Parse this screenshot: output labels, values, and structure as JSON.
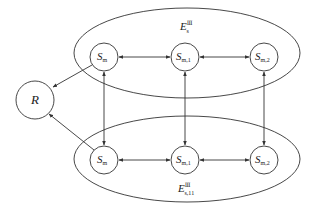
{
  "diagram": {
    "type": "state-graph",
    "colors": {
      "stroke": "#333333",
      "text": "#222222",
      "background": "#ffffff"
    },
    "root": {
      "id": "R",
      "label": "R"
    },
    "groups": [
      {
        "id": "top",
        "label_main": "E",
        "label_sup": "Ⅲ",
        "label_sub": "s",
        "nodes": [
          {
            "id": "t0",
            "main": "S",
            "sub": "m"
          },
          {
            "id": "t1",
            "main": "S",
            "sub": "m,1"
          },
          {
            "id": "t2",
            "main": "S",
            "sub": "m,2"
          }
        ]
      },
      {
        "id": "bottom",
        "label_main": "E",
        "label_sup": "Ⅲ",
        "label_sub": "s,11",
        "nodes": [
          {
            "id": "b0",
            "main": "S",
            "sub": "m"
          },
          {
            "id": "b1",
            "main": "S",
            "sub": "m,1"
          },
          {
            "id": "b2",
            "main": "S",
            "sub": "m,2"
          }
        ]
      }
    ],
    "edges": [
      {
        "from": "t0",
        "to": "R",
        "type": "directed"
      },
      {
        "from": "b0",
        "to": "R",
        "type": "directed"
      },
      {
        "from": "t0",
        "to": "t1",
        "type": "bidirectional"
      },
      {
        "from": "t1",
        "to": "t2",
        "type": "bidirectional"
      },
      {
        "from": "b0",
        "to": "b1",
        "type": "bidirectional"
      },
      {
        "from": "b1",
        "to": "b2",
        "type": "bidirectional"
      },
      {
        "from": "t0",
        "to": "b0",
        "type": "bidirectional"
      },
      {
        "from": "t1",
        "to": "b1",
        "type": "bidirectional"
      },
      {
        "from": "t2",
        "to": "b2",
        "type": "bidirectional"
      }
    ]
  }
}
